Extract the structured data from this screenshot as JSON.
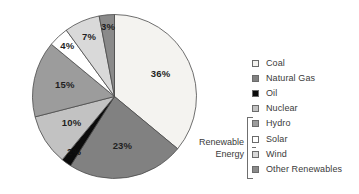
{
  "chart_data": {
    "type": "pie",
    "title": "",
    "subtitle": "",
    "xlabel": "",
    "ylabel": "",
    "legend_position": "right",
    "grid": false,
    "units": "percent",
    "start_angle_deg": 0,
    "direction": "clockwise",
    "categories": [
      "Coal",
      "Natural Gas",
      "Oil",
      "Nuclear",
      "Hydro",
      "Solar",
      "Wind",
      "Other Renewables"
    ],
    "values": [
      36,
      23,
      2,
      10,
      15,
      4,
      7,
      3
    ],
    "data_labels": [
      "36%",
      "23%",
      "2%",
      "10%",
      "15%",
      "4%",
      "7%",
      "3%"
    ],
    "colors": [
      "#f4f3f0",
      "#818181",
      "#0b0b0b",
      "#c2c2c2",
      "#9c9c9c",
      "#ffffff",
      "#d9d9d9",
      "#8a8a8a"
    ],
    "slice_outline_color": "#4a4a4a",
    "group_annotation": {
      "label": "Renewable\nEnergy",
      "members": [
        "Hydro",
        "Solar",
        "Wind",
        "Other Renewables"
      ]
    }
  },
  "legend": {
    "items": [
      {
        "label": "Coal",
        "color": "#f4f3f0",
        "value": 36
      },
      {
        "label": "Natural Gas",
        "color": "#818181",
        "value": 23
      },
      {
        "label": "Oil",
        "color": "#0b0b0b",
        "value": 2
      },
      {
        "label": "Nuclear",
        "color": "#c2c2c2",
        "value": 10
      },
      {
        "label": "Hydro",
        "color": "#9c9c9c",
        "value": 15
      },
      {
        "label": "Solar",
        "color": "#ffffff",
        "value": 4
      },
      {
        "label": "Wind",
        "color": "#d9d9d9",
        "value": 7
      },
      {
        "label": "Other Renewables",
        "color": "#8a8a8a",
        "value": 3
      }
    ]
  },
  "annotations": {
    "renewable_group_label": "Renewable\nEnergy"
  }
}
